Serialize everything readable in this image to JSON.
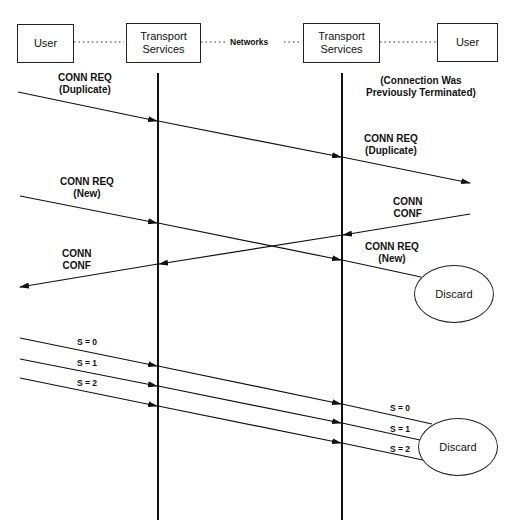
{
  "entities": {
    "user_left": "User",
    "ts_left_1": "Transport",
    "ts_left_2": "Services",
    "networks": "Networks",
    "ts_right_1": "Transport",
    "ts_right_2": "Services",
    "user_right": "User"
  },
  "labels": {
    "conn_req_dup_left_1": "CONN REQ",
    "conn_req_dup_left_2": "(Duplicate)",
    "prev_term_1": "(Connection Was",
    "prev_term_2": "Previously Terminated)",
    "conn_req_dup_right_1": "CONN REQ",
    "conn_req_dup_right_2": "(Duplicate)",
    "conn_req_new_left_1": "CONN REQ",
    "conn_req_new_left_2": "(New)",
    "conn_conf_right_1": "CONN",
    "conn_conf_right_2": "CONF",
    "conn_req_new_right_1": "CONN REQ",
    "conn_req_new_right_2": "(New)",
    "conn_conf_left_1": "CONN",
    "conn_conf_left_2": "CONF",
    "discard_1": "Discard",
    "s0_left": "S = 0",
    "s1_left": "S = 1",
    "s2_left": "S = 2",
    "s0_right": "S = 0",
    "s1_right": "S = 1",
    "s2_right": "S = 2",
    "discard_2": "Discard"
  }
}
